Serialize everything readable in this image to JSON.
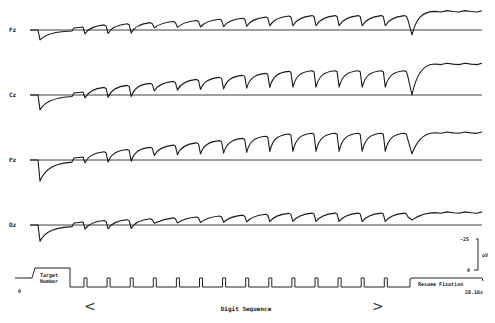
{
  "chart_data": {
    "type": "line",
    "title": "",
    "xlabel": "Digit Sequence",
    "ylabel": "uV",
    "time_end_label": "28.16s",
    "time_start_label": "0",
    "scale_bar": {
      "top_label": "-25",
      "bottom_label": "0",
      "unit": "uV"
    },
    "polarity_note": "negative up",
    "channels": [
      {
        "name": "Fz",
        "initial_dip": 8,
        "step_amplitude": 10,
        "final_level": 15,
        "resume_dip": -4
      },
      {
        "name": "Cz",
        "initial_dip": 12,
        "step_amplitude": 18,
        "final_level": 25,
        "resume_dip": 0
      },
      {
        "name": "Pz",
        "initial_dip": 17,
        "step_amplitude": 20,
        "final_level": 22,
        "resume_dip": 5
      },
      {
        "name": "Oz",
        "initial_dip": 13,
        "step_amplitude": 8,
        "final_level": 10,
        "resume_dip": 4
      }
    ],
    "events": {
      "target_label_line1": "Target",
      "target_label_line2": "Number",
      "digit_count": 14,
      "resume_label": "Resume Fixation"
    },
    "sequence_arrows": {
      "left": "<",
      "right": ">"
    }
  }
}
